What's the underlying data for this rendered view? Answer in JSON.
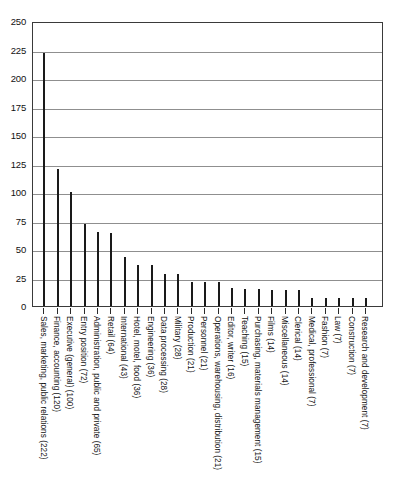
{
  "chart_data": {
    "type": "bar",
    "title": "",
    "subtitle": "",
    "xlabel": "",
    "ylabel": "",
    "ylim": [
      0,
      250
    ],
    "yticks": [
      0,
      25,
      50,
      75,
      100,
      125,
      150,
      175,
      200,
      225,
      250
    ],
    "ytick_labels": [
      "0",
      "25",
      "50",
      "75",
      "100",
      "125",
      "150",
      "175",
      "200",
      "225",
      "250"
    ],
    "grid": true,
    "legend": "none",
    "orientation": "vertical",
    "bar_color": "#1a1a1a",
    "gridline_color": "#8f8f8f",
    "frame_color": "#3a3a3a",
    "categories": [
      "Sales, marketing, public relations (222)",
      "Finance, accounting (120)",
      "Executive (general) (100)",
      "Entry position (72)",
      "Administration, public and private (65)",
      "Retail (64)",
      "International (43)",
      "Hotel, motel, food (36)",
      "Engineering (36)",
      "Data processing (28)",
      "Military (28)",
      "Production (21)",
      "Personnel (21)",
      "Operations, warehousing, distribution (21)",
      "Editor, writer (16)",
      "Teaching (15)",
      "Purchasing, materials management (15)",
      "Films (14)",
      "Miscellaneous (14)",
      "Clerical (14)",
      "Medical, professional (7)",
      "Fashion (7)",
      "Law (7)",
      "Construction (7)",
      "Research and development (7)"
    ],
    "values": [
      222,
      120,
      100,
      72,
      65,
      64,
      43,
      36,
      36,
      28,
      28,
      21,
      21,
      21,
      16,
      15,
      15,
      14,
      14,
      14,
      7,
      7,
      7,
      7,
      7
    ]
  }
}
